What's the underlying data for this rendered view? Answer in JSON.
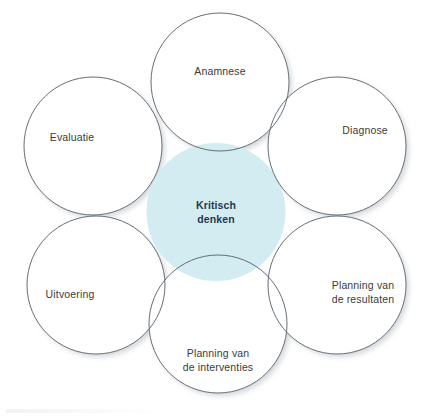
{
  "diagram": {
    "type": "venn-overlap",
    "background_color": "#ffffff",
    "circle_stroke_color": "#555d66",
    "circle_fill_color": "#ffffff",
    "overlap_fill_color": "#d3ecf2",
    "overlap_stroke_color": "#5d7d8c",
    "label_color": "#3b3b3b",
    "center_label_color": "#1f3a4d",
    "center": {
      "name": "kritisch-denken",
      "label": "Kritisch\ndenken",
      "cx": 216,
      "cy": 212
    },
    "circles": [
      {
        "name": "anamnese",
        "label": "Anamnese",
        "cx": 220,
        "cy": 82,
        "r": 69,
        "label_x": 220,
        "label_y": 72
      },
      {
        "name": "diagnose",
        "label": "Diagnose",
        "cx": 337,
        "cy": 146,
        "r": 69,
        "label_x": 365,
        "label_y": 131
      },
      {
        "name": "planning-van-de-resultaten",
        "label": "Planning van\nde resultaten",
        "cx": 337,
        "cy": 285,
        "r": 69,
        "label_x": 363,
        "label_y": 292
      },
      {
        "name": "planning-van-de-interventies",
        "label": "Planning van\nde interventies",
        "cx": 218,
        "cy": 324,
        "r": 69,
        "label_x": 218,
        "label_y": 360
      },
      {
        "name": "uitvoering",
        "label": "Uitvoering",
        "cx": 96,
        "cy": 285,
        "r": 69,
        "label_x": 70,
        "label_y": 295
      },
      {
        "name": "evaluatie",
        "label": "Evaluatie",
        "cx": 93,
        "cy": 146,
        "r": 69,
        "label_x": 72,
        "label_y": 138
      }
    ]
  }
}
